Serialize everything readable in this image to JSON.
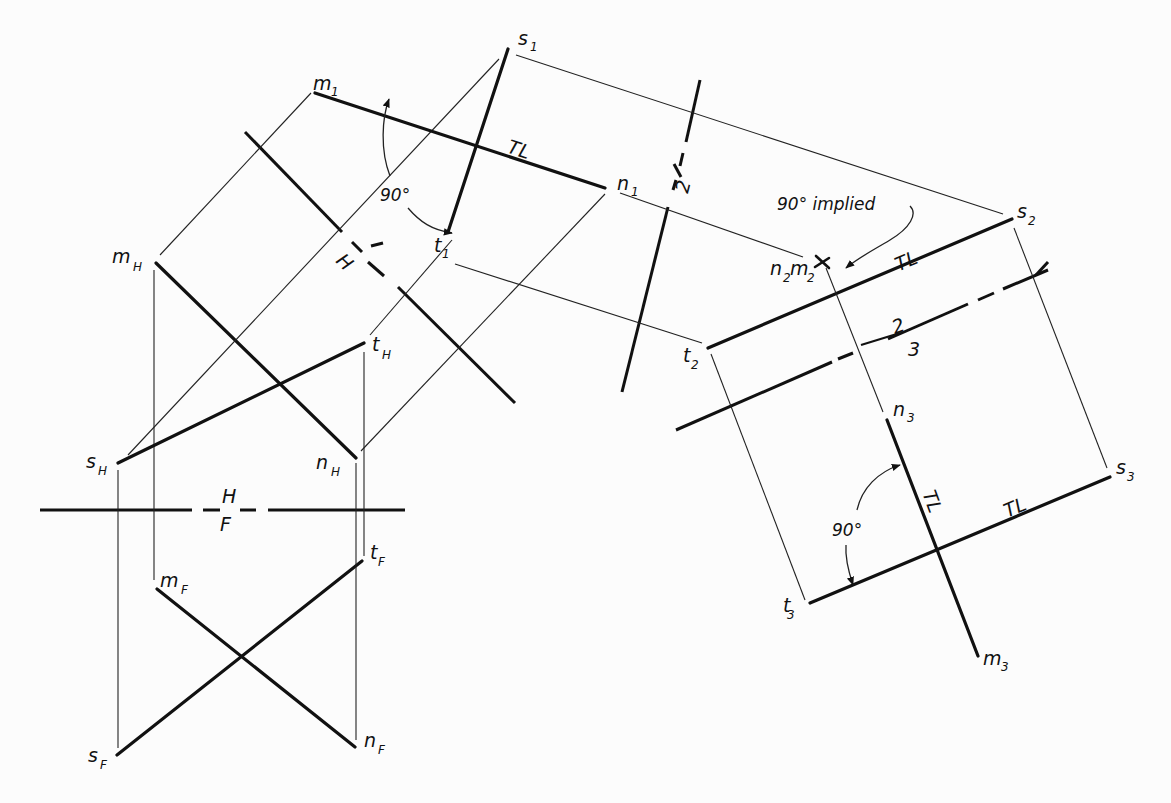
{
  "diagram": {
    "views": {
      "front": {
        "label_top": "H",
        "label_bottom": "F"
      },
      "top_aux1": {
        "label_top": "1",
        "label_bottom": "H"
      },
      "aux1_aux2": {
        "label_top": "1",
        "label_bottom": "2"
      },
      "aux2_aux3": {
        "label_top": "2",
        "label_bottom": "3"
      }
    },
    "points": {
      "m1": {
        "base": "m",
        "sub": "1"
      },
      "n1": {
        "base": "n",
        "sub": "1"
      },
      "s1": {
        "base": "s",
        "sub": "1"
      },
      "t1": {
        "base": "t",
        "sub": "1"
      },
      "mH": {
        "base": "m",
        "sub": "H"
      },
      "nH": {
        "base": "n",
        "sub": "H"
      },
      "sH": {
        "base": "s",
        "sub": "H"
      },
      "tH": {
        "base": "t",
        "sub": "H"
      },
      "mF": {
        "base": "m",
        "sub": "F"
      },
      "nF": {
        "base": "n",
        "sub": "F"
      },
      "sF": {
        "base": "s",
        "sub": "F"
      },
      "tF": {
        "base": "t",
        "sub": "F"
      },
      "n2m2": {
        "base1": "n",
        "sub1": "2",
        "base2": "m",
        "sub2": "2"
      },
      "s2": {
        "base": "s",
        "sub": "2"
      },
      "t2": {
        "base": "t",
        "sub": "2"
      },
      "n3": {
        "base": "n",
        "sub": "3"
      },
      "m3": {
        "base": "m",
        "sub": "3"
      },
      "s3": {
        "base": "s",
        "sub": "3"
      },
      "t3": {
        "base": "t",
        "sub": "3"
      }
    },
    "annotations": {
      "tl_view1": "TL",
      "angle_view1": "90°",
      "implied_note": "90° implied",
      "tl_view2": "TL",
      "tl_view3_mn": "TL",
      "tl_view3_st": "TL",
      "angle_view3": "90°"
    },
    "colors": {
      "ink": "#111111",
      "paper": "#fcfcfc"
    }
  }
}
